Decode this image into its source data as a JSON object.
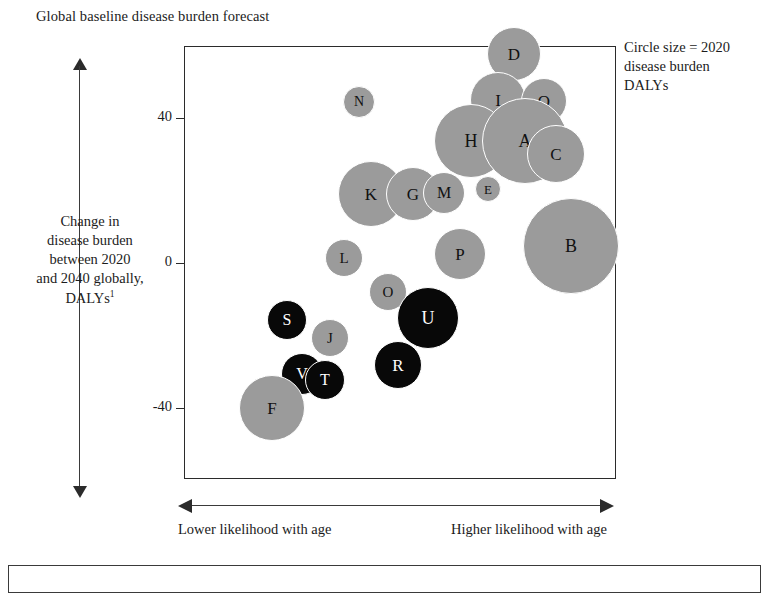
{
  "title": "Global baseline disease burden forecast",
  "legend": {
    "line1": "Circle size = 2020",
    "line2": "disease burden",
    "line3": "DALYs"
  },
  "yaxis": {
    "caption_line1": "Change in",
    "caption_line2": "disease burden",
    "caption_line3": "between 2020",
    "caption_line4": "and 2040 globally,",
    "caption_line5": "DALYs",
    "caption_superscript": "1",
    "ticks": [
      "40",
      "0",
      "-40"
    ]
  },
  "xaxis": {
    "label_left": "Lower likelihood with age",
    "label_right": "Higher likelihood with age"
  },
  "colors": {
    "gray_bubble": "#9b9b9b",
    "dark_bubble": "#080808",
    "gray_label": "#111111",
    "dark_label": "#ffffff",
    "frame": "#2b2b2b",
    "gridline": "#3a3a3a",
    "background": "#ffffff"
  },
  "chart_data": {
    "type": "scatter",
    "title": "Global baseline disease burden forecast",
    "xlabel": "Likelihood with age (lower → higher)",
    "ylabel": "Change in disease burden between 2020 and 2040 globally, DALYs",
    "grid": true,
    "legend": "Circle size = 2020 disease burden DALYs",
    "legend_position": "top-right",
    "xlim": [
      0,
      6
    ],
    "ylim": [
      -80,
      80
    ],
    "yticks": [
      40,
      0,
      -40
    ],
    "size_encodes": "2020 disease burden DALYs",
    "note": "x axis is an unlabeled ordinal likelihood-with-age scale (6 grid columns); y values read off the 40 / 0 / -40 gridlines",
    "points": [
      {
        "label": "A",
        "x": 4.7,
        "y": 39,
        "size": 43,
        "color": "gray"
      },
      {
        "label": "B",
        "x": 5.36,
        "y": 3,
        "size": 48,
        "color": "gray"
      },
      {
        "label": "C",
        "x": 5.14,
        "y": 32,
        "size": 29,
        "color": "gray"
      },
      {
        "label": "D",
        "x": 4.57,
        "y": 64,
        "size": 27,
        "color": "gray"
      },
      {
        "label": "E",
        "x": 4.2,
        "y": 21,
        "size": 13,
        "color": "gray"
      },
      {
        "label": "F",
        "x": 1.21,
        "y": -43,
        "size": 33,
        "color": "gray"
      },
      {
        "label": "G",
        "x": 3.17,
        "y": 21,
        "size": 27,
        "color": "gray"
      },
      {
        "label": "H",
        "x": 3.97,
        "y": 35,
        "size": 37,
        "color": "gray"
      },
      {
        "label": "I",
        "x": 4.34,
        "y": 52,
        "size": 28,
        "color": "gray"
      },
      {
        "label": "J",
        "x": 1.99,
        "y": -19,
        "size": 19,
        "color": "gray"
      },
      {
        "label": "K",
        "x": 2.58,
        "y": 21,
        "size": 33,
        "color": "gray"
      },
      {
        "label": "L",
        "x": 2.19,
        "y": 0,
        "size": 19,
        "color": "gray"
      },
      {
        "label": "M",
        "x": 3.58,
        "y": 21,
        "size": 21,
        "color": "gray"
      },
      {
        "label": "N",
        "x": 2.41,
        "y": 47,
        "size": 16,
        "color": "gray"
      },
      {
        "label": "O",
        "x": 2.8,
        "y": -8,
        "size": 19,
        "color": "gray"
      },
      {
        "label": "P",
        "x": 3.81,
        "y": 1,
        "size": 26,
        "color": "gray"
      },
      {
        "label": "Q",
        "x": 4.97,
        "y": 51,
        "size": 23,
        "color": "gray"
      },
      {
        "label": "R",
        "x": 2.96,
        "y": -27,
        "size": 24,
        "color": "dark"
      },
      {
        "label": "S",
        "x": 1.42,
        "y": -18,
        "size": 20,
        "color": "dark"
      },
      {
        "label": "T",
        "x": 1.93,
        "y": -30,
        "size": 20,
        "color": "dark"
      },
      {
        "label": "U",
        "x": 3.38,
        "y": -16,
        "size": 31,
        "color": "dark"
      },
      {
        "label": "V",
        "x": 1.62,
        "y": -28,
        "size": 21,
        "color": "dark"
      }
    ]
  },
  "bubbles": [
    {
      "label": "D",
      "cx": 513,
      "cy": 53,
      "r": 27,
      "color": "gray",
      "font": 17
    },
    {
      "label": "I",
      "cx": 497,
      "cy": 99,
      "r": 28,
      "color": "gray",
      "font": 17
    },
    {
      "label": "Q",
      "cx": 543,
      "cy": 100,
      "r": 23,
      "color": "gray",
      "font": 17
    },
    {
      "label": "N",
      "cx": 358,
      "cy": 101,
      "r": 16,
      "color": "gray",
      "font": 14
    },
    {
      "label": "H",
      "cx": 470,
      "cy": 140,
      "r": 37,
      "color": "gray",
      "font": 18
    },
    {
      "label": "A",
      "cx": 524,
      "cy": 140,
      "r": 43,
      "color": "gray",
      "font": 18
    },
    {
      "label": "C",
      "cx": 555,
      "cy": 153,
      "r": 29,
      "color": "gray",
      "font": 17
    },
    {
      "label": "K",
      "cx": 370,
      "cy": 193,
      "r": 33,
      "color": "gray",
      "font": 17
    },
    {
      "label": "G",
      "cx": 412,
      "cy": 193,
      "r": 27,
      "color": "gray",
      "font": 17
    },
    {
      "label": "M",
      "cx": 443,
      "cy": 192,
      "r": 21,
      "color": "gray",
      "font": 16
    },
    {
      "label": "E",
      "cx": 487,
      "cy": 188,
      "r": 13,
      "color": "gray",
      "font": 13
    },
    {
      "label": "B",
      "cx": 570,
      "cy": 245,
      "r": 48,
      "color": "gray",
      "font": 18
    },
    {
      "label": "L",
      "cx": 343,
      "cy": 257,
      "r": 19,
      "color": "gray",
      "font": 15
    },
    {
      "label": "P",
      "cx": 459,
      "cy": 253,
      "r": 26,
      "color": "gray",
      "font": 17
    },
    {
      "label": "O",
      "cx": 387,
      "cy": 291,
      "r": 19,
      "color": "gray",
      "font": 15
    },
    {
      "label": "S",
      "cx": 286,
      "cy": 319,
      "r": 20,
      "color": "dark",
      "font": 16
    },
    {
      "label": "U",
      "cx": 427,
      "cy": 317,
      "r": 31,
      "color": "dark",
      "font": 18
    },
    {
      "label": "J",
      "cx": 329,
      "cy": 337,
      "r": 19,
      "color": "gray",
      "font": 15
    },
    {
      "label": "R",
      "cx": 397,
      "cy": 364,
      "r": 24,
      "color": "dark",
      "font": 17
    },
    {
      "label": "V",
      "cx": 301,
      "cy": 373,
      "r": 21,
      "color": "dark",
      "font": 16
    },
    {
      "label": "T",
      "cx": 324,
      "cy": 379,
      "r": 20,
      "color": "dark",
      "font": 16
    },
    {
      "label": "F",
      "cx": 271,
      "cy": 407,
      "r": 33,
      "color": "gray",
      "font": 17
    }
  ],
  "grid": {
    "frame": {
      "left": 184,
      "top": 46,
      "width": 432,
      "height": 433
    },
    "v_lines": [
      72,
      145,
      217,
      289,
      361
    ],
    "h_lines": [
      72,
      145,
      217,
      290,
      362
    ],
    "ytick_rows": [
      {
        "value": "40",
        "y": 118
      },
      {
        "value": "0",
        "y": 263
      },
      {
        "value": "-40",
        "y": 408
      }
    ]
  }
}
